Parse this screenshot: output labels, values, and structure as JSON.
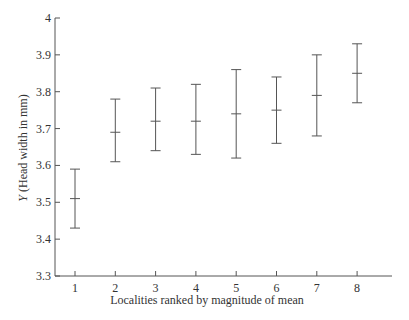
{
  "chart_data": {
    "type": "errorbar",
    "title": "",
    "xlabel": "Localities ranked by magnitude of mean",
    "ylabel_italic": "Y",
    "ylabel_rest": " (Head width in mm)",
    "ylim": [
      3.3,
      4.0
    ],
    "yticks": [
      3.3,
      3.4,
      3.5,
      3.6,
      3.7,
      3.8,
      3.9,
      4
    ],
    "ytick_labels": [
      "3.3",
      "3.4",
      "3.5",
      "3.6",
      "3.7",
      "3.8",
      "3.9",
      "4"
    ],
    "categories": [
      "1",
      "2",
      "3",
      "4",
      "5",
      "6",
      "7",
      "8"
    ],
    "grid": false,
    "legend": null,
    "series": [
      {
        "name": "Head width",
        "means": [
          3.51,
          3.69,
          3.72,
          3.72,
          3.74,
          3.75,
          3.79,
          3.85
        ],
        "upper": [
          3.59,
          3.78,
          3.81,
          3.82,
          3.86,
          3.84,
          3.9,
          3.93
        ],
        "lower": [
          3.43,
          3.61,
          3.64,
          3.63,
          3.62,
          3.66,
          3.68,
          3.77
        ]
      }
    ]
  },
  "colors": {
    "axis": "#555555",
    "bar": "#555555",
    "text": "#333333"
  }
}
